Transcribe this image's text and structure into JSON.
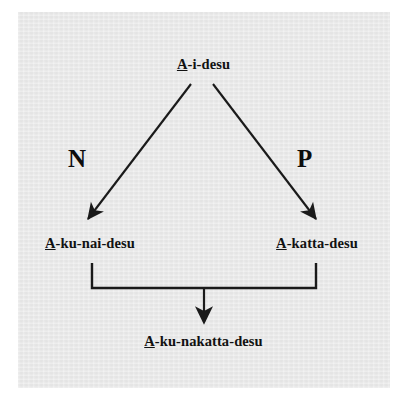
{
  "figure": {
    "panel_color": "#e8e8e8",
    "background_color": "#ffffff",
    "line_color": "#1a1a1a"
  },
  "nodes": {
    "top": {
      "stem": "A",
      "rest": "-i-desu",
      "full": "A-i-desu"
    },
    "left": {
      "stem": "A",
      "rest": "-ku-nai-desu",
      "full": "A-ku-nai-desu"
    },
    "right": {
      "stem": "A",
      "rest": "-katta-desu",
      "full": "A-katta-desu"
    },
    "bottom": {
      "stem": "A",
      "rest": "-ku-nakatta-desu",
      "full": "A-ku-nakatta-desu"
    }
  },
  "edge_labels": {
    "negative": "N",
    "past": "P"
  }
}
